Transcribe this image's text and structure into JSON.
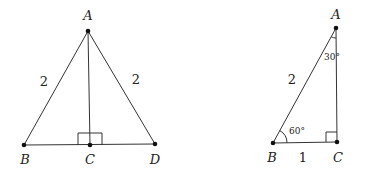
{
  "figures": [
    {
      "id": "isosceles-triangle",
      "points": {
        "A": {
          "label": "A",
          "x": 88,
          "y": 31,
          "lx": 88,
          "ly": 20
        },
        "B": {
          "label": "B",
          "x": 24,
          "y": 145,
          "lx": 25,
          "ly": 164
        },
        "C": {
          "label": "C",
          "x": 90,
          "y": 145,
          "lx": 90,
          "ly": 164
        },
        "D": {
          "label": "D",
          "x": 155,
          "y": 144,
          "lx": 155,
          "ly": 164
        }
      },
      "side_labels": {
        "AB": {
          "text": "2",
          "x": 44,
          "y": 86
        },
        "AD": {
          "text": "2",
          "x": 136,
          "y": 84
        }
      },
      "right_angle_at": "C"
    },
    {
      "id": "30-60-90-triangle",
      "points": {
        "A": {
          "label": "A",
          "x": 336,
          "y": 28,
          "lx": 336,
          "ly": 19
        },
        "B": {
          "label": "B",
          "x": 273,
          "y": 143,
          "lx": 272,
          "ly": 162
        },
        "C": {
          "label": "C",
          "x": 337,
          "y": 142,
          "lx": 338,
          "ly": 162
        }
      },
      "side_labels": {
        "AB": {
          "text": "2",
          "x": 292,
          "y": 84
        },
        "BC": {
          "text": "1",
          "x": 303,
          "y": 162
        }
      },
      "angle_labels": {
        "A": {
          "text": "30°",
          "x": 333,
          "y": 60
        },
        "B": {
          "text": "60°",
          "x": 296,
          "y": 134
        }
      },
      "right_angle_at": "C"
    }
  ]
}
